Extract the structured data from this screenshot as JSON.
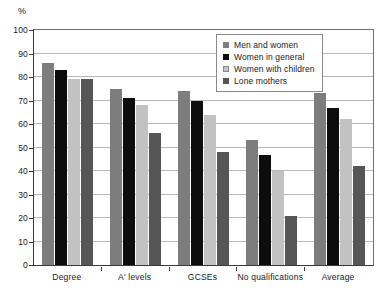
{
  "chart_data": {
    "type": "bar",
    "title": "",
    "xlabel": "",
    "ylabel": "%",
    "ylim": [
      0,
      100
    ],
    "ytick_step": 10,
    "yticks": [
      0,
      10,
      20,
      30,
      40,
      50,
      60,
      70,
      80,
      90,
      100
    ],
    "grid": true,
    "legend_position": "inside-top-right",
    "categories": [
      "Degree",
      "A' levels",
      "GCSEs",
      "No qualifications",
      "Average"
    ],
    "series": [
      {
        "name": "Men and women",
        "color": "#7d7d7d",
        "values": [
          86,
          75,
          74,
          53,
          73
        ]
      },
      {
        "name": "Women in general",
        "color": "#0d0d0d",
        "values": [
          83,
          71,
          70,
          47,
          67
        ]
      },
      {
        "name": "Women with children",
        "color": "#c2c2c2",
        "values": [
          79,
          68,
          64,
          40,
          62
        ]
      },
      {
        "name": "Lone mothers",
        "color": "#565656",
        "values": [
          79,
          56,
          48,
          21,
          42
        ]
      }
    ]
  },
  "axis": {
    "unit_label": "%"
  }
}
